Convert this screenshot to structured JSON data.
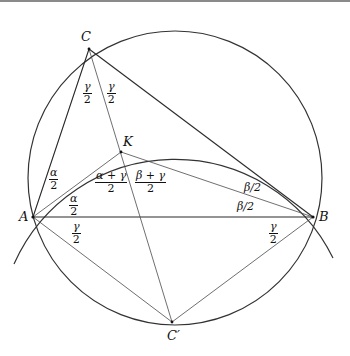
{
  "figure": {
    "points": {
      "A": {
        "label": "A",
        "x": 33,
        "y": 217
      },
      "B": {
        "label": "B",
        "x": 313,
        "y": 217
      },
      "C": {
        "label": "C",
        "x": 89,
        "y": 49
      },
      "K": {
        "label": "K",
        "x": 121,
        "y": 152
      },
      "Cp": {
        "label": "C′",
        "x": 172,
        "y": 322
      }
    },
    "circumcircle": {
      "cx": 175,
      "cy": 178,
      "r": 147
    },
    "arc_AKB": {
      "center": "C′",
      "r": 176
    },
    "angle_labels": {
      "gamma_half_left": {
        "num": "γ",
        "den": "2"
      },
      "gamma_half_right": {
        "num": "γ",
        "den": "2"
      },
      "alpha_half_upper": {
        "num": "α",
        "den": "2"
      },
      "alpha_half_lower": {
        "num": "α",
        "den": "2"
      },
      "alpha_plus_gamma": {
        "num": "α + γ",
        "den": "2"
      },
      "beta_plus_gamma": {
        "num": "β + γ",
        "den": "2"
      },
      "beta_half_upper": "β/2",
      "beta_half_lower": "β/2",
      "gamma_half_A": {
        "num": "γ",
        "den": "2"
      },
      "gamma_half_B": {
        "num": "γ",
        "den": "2"
      }
    },
    "colors": {
      "stroke": "#2a2a2a",
      "background": "#ffffff",
      "top_border": "#8a8a8a"
    }
  }
}
